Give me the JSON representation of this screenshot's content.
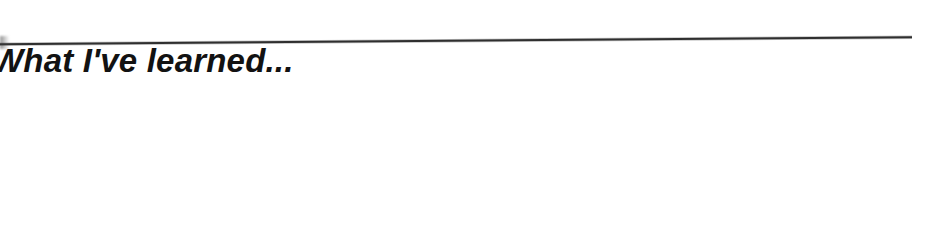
{
  "page": {
    "background_color": "#ffffff",
    "width": 947,
    "height": 245
  },
  "heading": {
    "text": "What I've learned...",
    "color": "#121212",
    "style": "bold italic",
    "clipped_at_left_edge": true
  },
  "rule": {
    "name": "horizontal-rule",
    "color": "#1b1b1b",
    "start": {
      "x": 0,
      "y": 26
    },
    "end": {
      "x": 912,
      "y": 19
    },
    "thickness": 2
  },
  "body": {
    "content": ""
  }
}
